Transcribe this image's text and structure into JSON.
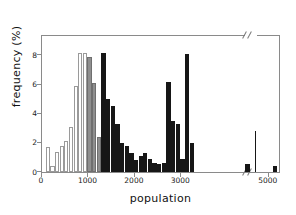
{
  "chart_data": {
    "type": "bar",
    "title": "",
    "xlabel": "population",
    "ylabel": "frequency (%)",
    "xlim": [
      0,
      5300
    ],
    "ylim": [
      0,
      9.4
    ],
    "grid": false,
    "legend": "none",
    "axis_break": {
      "from": 4650,
      "to": 4900,
      "note": "x-axis break before 5000"
    },
    "bin_width": 100,
    "xticks": [
      0,
      1000,
      2000,
      3000,
      5000
    ],
    "xtick_labels": [
      "0",
      "1000",
      "2000",
      "3000",
      "5000"
    ],
    "yticks": [
      0,
      2,
      4,
      6,
      8
    ],
    "ytick_labels": [
      "0",
      "2",
      "4",
      "6",
      "8"
    ],
    "series": [
      {
        "name": "low-population group",
        "color": "#ffffff",
        "edge": "#9a9a9a",
        "bins": [
          {
            "x": 100,
            "value": 1.7
          },
          {
            "x": 200,
            "value": 0.4
          },
          {
            "x": 300,
            "value": 1.4
          },
          {
            "x": 400,
            "value": 1.8
          },
          {
            "x": 500,
            "value": 2.1
          },
          {
            "x": 600,
            "value": 3.1
          },
          {
            "x": 700,
            "value": 5.9
          },
          {
            "x": 800,
            "value": 8.2
          },
          {
            "x": 900,
            "value": 8.2
          }
        ]
      },
      {
        "name": "mid-population group",
        "color": "#8f8f8f",
        "edge": "#6f6f6f",
        "bins": [
          {
            "x": 1000,
            "value": 7.9
          },
          {
            "x": 1100,
            "value": 6.1
          },
          {
            "x": 1200,
            "value": 2.4
          }
        ]
      },
      {
        "name": "high-population group",
        "color": "#161616",
        "edge": "#161616",
        "bins": [
          {
            "x": 1300,
            "value": 8.2
          },
          {
            "x": 1400,
            "value": 5.0
          },
          {
            "x": 1500,
            "value": 4.5
          },
          {
            "x": 1600,
            "value": 3.3
          },
          {
            "x": 1700,
            "value": 2.0
          },
          {
            "x": 1800,
            "value": 1.8
          },
          {
            "x": 1900,
            "value": 1.3
          },
          {
            "x": 2000,
            "value": 0.8
          },
          {
            "x": 2100,
            "value": 1.1
          },
          {
            "x": 2200,
            "value": 1.3
          },
          {
            "x": 2300,
            "value": 0.9
          },
          {
            "x": 2400,
            "value": 0.6
          },
          {
            "x": 2500,
            "value": 0.55
          },
          {
            "x": 2600,
            "value": 0.6
          },
          {
            "x": 2700,
            "value": 6.2
          },
          {
            "x": 2800,
            "value": 3.5
          },
          {
            "x": 2900,
            "value": 3.3
          },
          {
            "x": 3000,
            "value": 0.9
          },
          {
            "x": 3100,
            "value": 8.1
          },
          {
            "x": 3200,
            "value": 2.0
          },
          {
            "x": 4400,
            "value": 0.55
          },
          {
            "x": 4600,
            "value": 2.8
          },
          {
            "x": 5100,
            "value": 0.4
          }
        ]
      }
    ]
  }
}
